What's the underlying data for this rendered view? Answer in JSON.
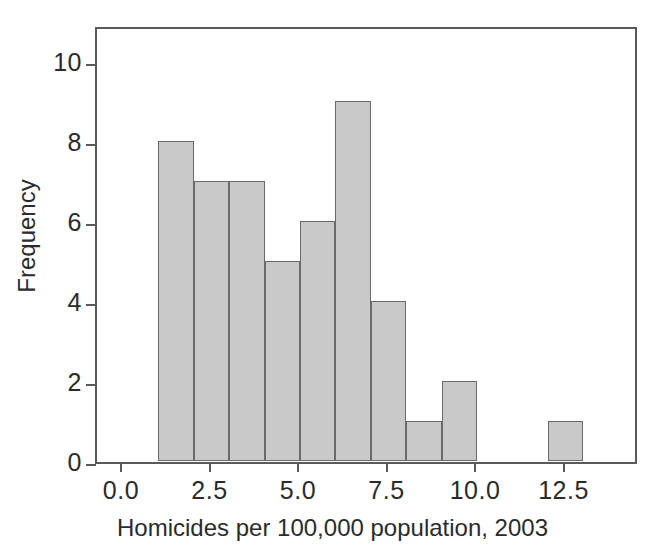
{
  "chart_data": {
    "type": "bar",
    "title": "",
    "xlabel": "Homicides per 100,000 population, 2003",
    "ylabel": "Frequency",
    "bin_width": 1,
    "bin_starts": [
      1,
      2,
      3,
      4,
      5,
      6,
      7,
      8,
      9,
      10,
      11,
      12
    ],
    "categories": [
      "1-2",
      "2-3",
      "3-4",
      "4-5",
      "5-6",
      "6-7",
      "7-8",
      "8-9",
      "9-10",
      "10-11",
      "11-12",
      "12-13"
    ],
    "values": [
      8,
      7,
      7,
      5,
      6,
      9,
      4,
      1,
      2,
      0,
      0,
      1
    ],
    "xlim": [
      -0.6,
      14.5
    ],
    "ylim": [
      0,
      10.9
    ],
    "xticks": [
      0.0,
      2.5,
      5.0,
      7.5,
      10.0,
      12.5
    ],
    "xticklabels": [
      "0.0",
      "2.5",
      "5.0",
      "7.5",
      "10.0",
      "12.5"
    ],
    "yticks": [
      0,
      2,
      4,
      6,
      8,
      10
    ],
    "yticklabels": [
      "0",
      "2",
      "4",
      "6",
      "8",
      "10"
    ],
    "grid": false,
    "legend": "none",
    "bar_fill_color": "#c9c9c9",
    "bar_edge_color": "#6a6a6a",
    "axis_color": "#5a5a5a",
    "text_color": "#2b2b2b",
    "background_color": "#ffffff"
  }
}
